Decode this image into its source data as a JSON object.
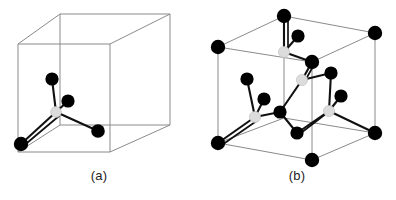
{
  "figure": {
    "background_color": "#ffffff",
    "edge_color": "#8a8a8a",
    "bond_color": "#111111",
    "atom_dark_color": "#000000",
    "atom_light_color": "#dcdcdc",
    "width": 396,
    "height": 200
  },
  "panels": [
    {
      "id": "a",
      "caption": "(a)",
      "description": "Single cube outline containing one tetrahedral bonding unit: a light central atom bonded to four dark atoms",
      "cube": {
        "front_face": [
          {
            "x": 18,
            "y": 44
          },
          {
            "x": 110,
            "y": 44
          },
          {
            "x": 110,
            "y": 152
          },
          {
            "x": 18,
            "y": 152
          }
        ],
        "back_face": [
          {
            "x": 60,
            "y": 14
          },
          {
            "x": 170,
            "y": 14
          },
          {
            "x": 170,
            "y": 125
          },
          {
            "x": 60,
            "y": 125
          }
        ]
      },
      "atoms": [
        {
          "id": "a-center",
          "x": 56,
          "y": 112,
          "r": 5.4,
          "type": "light"
        },
        {
          "id": "a-top",
          "x": 52,
          "y": 79,
          "r": 6.6,
          "type": "dark"
        },
        {
          "id": "a-mid",
          "x": 68,
          "y": 101,
          "r": 6.6,
          "type": "dark"
        },
        {
          "id": "a-left",
          "x": 21,
          "y": 144,
          "r": 7.2,
          "type": "dark"
        },
        {
          "id": "a-right",
          "x": 98,
          "y": 131,
          "r": 6.8,
          "type": "dark"
        }
      ],
      "bonds": [
        {
          "from": "a-center",
          "to": "a-top"
        },
        {
          "from": "a-center",
          "to": "a-mid"
        },
        {
          "from": "a-center",
          "to": "a-left"
        },
        {
          "from": "a-center",
          "to": "a-right"
        }
      ]
    },
    {
      "id": "b",
      "caption": "(b)",
      "description": "Full diamond cubic unit cell: eight corner atoms, six face-center atoms and four interior tetrahedrally bonded atoms",
      "cube": {
        "front_face": [
          {
            "x": 20,
            "y": 47
          },
          {
            "x": 114,
            "y": 47
          },
          {
            "x": 114,
            "y": 160
          },
          {
            "x": 20,
            "y": 143
          }
        ],
        "back_face": [
          {
            "x": 86,
            "y": 16
          },
          {
            "x": 177,
            "y": 33
          },
          {
            "x": 177,
            "y": 133
          },
          {
            "x": 86,
            "y": 118
          }
        ]
      },
      "atoms": [
        {
          "id": "b-c1",
          "x": 86,
          "y": 16,
          "r": 7.2,
          "type": "dark"
        },
        {
          "id": "b-c2",
          "x": 177,
          "y": 33,
          "r": 7.2,
          "type": "dark"
        },
        {
          "id": "b-c3",
          "x": 20,
          "y": 47,
          "r": 7.2,
          "type": "dark"
        },
        {
          "id": "b-c4",
          "x": 114,
          "y": 62,
          "r": 7.2,
          "type": "dark"
        },
        {
          "id": "b-c5",
          "x": 20,
          "y": 143,
          "r": 7.2,
          "type": "dark"
        },
        {
          "id": "b-c6",
          "x": 177,
          "y": 133,
          "r": 7.2,
          "type": "dark"
        },
        {
          "id": "b-c7",
          "x": 114,
          "y": 160,
          "r": 7.2,
          "type": "dark"
        },
        {
          "id": "b-f-top",
          "x": 86,
          "y": 52,
          "r": 5.6,
          "type": "light"
        },
        {
          "id": "b-f-mid",
          "x": 104,
          "y": 80,
          "r": 5.6,
          "type": "light"
        },
        {
          "id": "b-f-left",
          "x": 57,
          "y": 117,
          "r": 5.6,
          "type": "light"
        },
        {
          "id": "b-f-right",
          "x": 131,
          "y": 111,
          "r": 5.6,
          "type": "light"
        },
        {
          "id": "b-i1",
          "x": 100,
          "y": 36,
          "r": 6.6,
          "type": "dark"
        },
        {
          "id": "b-i2",
          "x": 49,
          "y": 79,
          "r": 6.6,
          "type": "dark"
        },
        {
          "id": "b-i3",
          "x": 133,
          "y": 73,
          "r": 6.6,
          "type": "dark"
        },
        {
          "id": "b-i4",
          "x": 66,
          "y": 99,
          "r": 6.6,
          "type": "dark"
        },
        {
          "id": "b-i5",
          "x": 143,
          "y": 96,
          "r": 6.6,
          "type": "dark"
        },
        {
          "id": "b-i6",
          "x": 82,
          "y": 112,
          "r": 6.6,
          "type": "dark"
        },
        {
          "id": "b-i7",
          "x": 99,
          "y": 133,
          "r": 6.6,
          "type": "dark"
        }
      ],
      "bonds": [
        {
          "from": "b-f-top",
          "to": "b-c1"
        },
        {
          "from": "b-f-top",
          "to": "b-i1"
        },
        {
          "from": "b-f-top",
          "to": "b-c4"
        },
        {
          "from": "b-f-mid",
          "to": "b-c4"
        },
        {
          "from": "b-f-mid",
          "to": "b-i3"
        },
        {
          "from": "b-f-mid",
          "to": "b-i6"
        },
        {
          "from": "b-f-left",
          "to": "b-i2"
        },
        {
          "from": "b-f-left",
          "to": "b-i4"
        },
        {
          "from": "b-f-left",
          "to": "b-c5"
        },
        {
          "from": "b-f-left",
          "to": "b-i6"
        },
        {
          "from": "b-f-right",
          "to": "b-i5"
        },
        {
          "from": "b-f-right",
          "to": "b-i7"
        },
        {
          "from": "b-f-right",
          "to": "b-c6"
        },
        {
          "from": "b-f-right",
          "to": "b-i3"
        },
        {
          "from": "b-i6",
          "to": "b-i7"
        }
      ]
    }
  ]
}
